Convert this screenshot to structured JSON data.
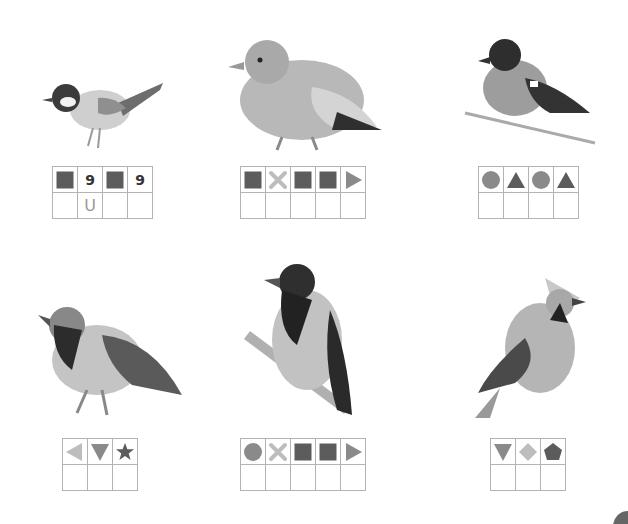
{
  "colors": {
    "dark": "#5c5c5c",
    "mid": "#8a8a8a",
    "light": "#bdbdbd",
    "grid_line": "#b3b3b3"
  },
  "birds": [
    {
      "name": "great-tit",
      "code": [
        {
          "shape": "square",
          "tone": "dark"
        },
        {
          "shape": "text",
          "text": "9"
        },
        {
          "shape": "square",
          "tone": "dark"
        },
        {
          "shape": "text",
          "text": "9"
        }
      ],
      "answers": [
        "",
        "U",
        "",
        ""
      ]
    },
    {
      "name": "pigeon",
      "code": [
        {
          "shape": "square",
          "tone": "dark"
        },
        {
          "shape": "cross",
          "tone": "light"
        },
        {
          "shape": "square",
          "tone": "dark"
        },
        {
          "shape": "square",
          "tone": "dark"
        },
        {
          "shape": "triangle-right",
          "tone": "mid"
        }
      ],
      "answers": [
        "",
        "",
        "",
        "",
        ""
      ]
    },
    {
      "name": "bullfinch",
      "code": [
        {
          "shape": "circle",
          "tone": "mid"
        },
        {
          "shape": "triangle-up",
          "tone": "dark"
        },
        {
          "shape": "circle",
          "tone": "mid"
        },
        {
          "shape": "triangle-up",
          "tone": "dark"
        }
      ],
      "answers": [
        "",
        "",
        "",
        ""
      ]
    },
    {
      "name": "sparrow",
      "code": [
        {
          "shape": "triangle-left",
          "tone": "light"
        },
        {
          "shape": "triangle-down",
          "tone": "mid"
        },
        {
          "shape": "star",
          "tone": "dark"
        }
      ],
      "answers": [
        "",
        "",
        ""
      ]
    },
    {
      "name": "hooded-crow",
      "code": [
        {
          "shape": "circle",
          "tone": "mid"
        },
        {
          "shape": "cross",
          "tone": "light"
        },
        {
          "shape": "square",
          "tone": "dark"
        },
        {
          "shape": "square",
          "tone": "dark"
        },
        {
          "shape": "triangle-right",
          "tone": "mid"
        }
      ],
      "answers": [
        "",
        "",
        "",
        "",
        ""
      ]
    },
    {
      "name": "waxwing",
      "code": [
        {
          "shape": "triangle-down",
          "tone": "mid"
        },
        {
          "shape": "diamond",
          "tone": "light"
        },
        {
          "shape": "pentagon",
          "tone": "dark"
        }
      ],
      "answers": [
        "",
        "",
        ""
      ]
    }
  ],
  "layout": [
    {
      "bird": {
        "x": 38,
        "y": 68,
        "w": 130,
        "h": 85
      },
      "grid": {
        "x": 52,
        "y": 166
      }
    },
    {
      "bird": {
        "x": 222,
        "y": 32,
        "w": 162,
        "h": 122
      },
      "grid": {
        "x": 240,
        "y": 166
      }
    },
    {
      "bird": {
        "x": 460,
        "y": 33,
        "w": 140,
        "h": 115
      },
      "grid": {
        "x": 478,
        "y": 166
      }
    },
    {
      "bird": {
        "x": 32,
        "y": 295,
        "w": 160,
        "h": 125
      },
      "grid": {
        "x": 62,
        "y": 438
      }
    },
    {
      "bird": {
        "x": 242,
        "y": 260,
        "w": 122,
        "h": 160
      },
      "grid": {
        "x": 240,
        "y": 438
      }
    },
    {
      "bird": {
        "x": 470,
        "y": 268,
        "w": 118,
        "h": 152
      },
      "grid": {
        "x": 490,
        "y": 438
      }
    }
  ]
}
